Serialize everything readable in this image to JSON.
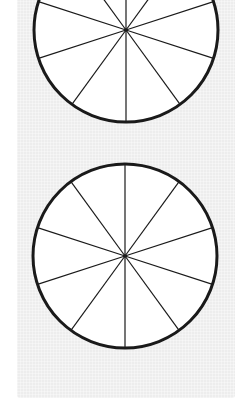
{
  "figure": {
    "background": "#ffffff",
    "panel_color": "#ededed",
    "stroke_color": "#1a1a1a",
    "circles": [
      {
        "name": "top-circle",
        "cx": 126,
        "cy": 30,
        "r": 92,
        "segments": 10,
        "rotation_deg": 90,
        "outline_width": 3,
        "spoke_width": 1.2
      },
      {
        "name": "bottom-circle",
        "cx": 125,
        "cy": 256,
        "r": 92,
        "segments": 10,
        "rotation_deg": 90,
        "outline_width": 3,
        "spoke_width": 1.2
      }
    ]
  }
}
